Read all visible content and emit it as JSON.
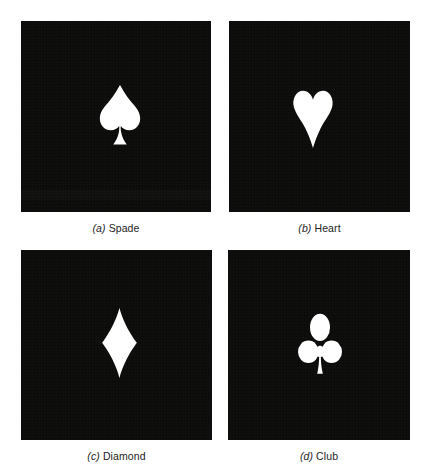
{
  "figure": {
    "background_color": "#ffffff",
    "panel_color": "#0a0a09",
    "symbol_color": "#ffffff",
    "caption_color": "#1c1c1c",
    "layout": "2x2 grid of four black square panels, each containing one white card-suit symbol, with an italic-lettered caption beneath each panel"
  },
  "panels": [
    {
      "letter": "(a)",
      "name": "Spade",
      "icon": "spade-icon",
      "caption_letter": "(a)",
      "caption_text": "Spade"
    },
    {
      "letter": "(b)",
      "name": "Heart",
      "icon": "heart-icon",
      "caption_letter": "(b)",
      "caption_text": "Heart"
    },
    {
      "letter": "(c)",
      "name": "Diamond",
      "icon": "diamond-icon",
      "caption_letter": "(c)",
      "caption_text": "Diamond"
    },
    {
      "letter": "(d)",
      "name": "Club",
      "icon": "club-icon",
      "caption_letter": "(d)",
      "caption_text": "Club"
    }
  ]
}
